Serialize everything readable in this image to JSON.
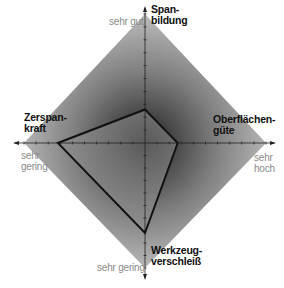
{
  "chart_data": {
    "type": "radar",
    "title": "",
    "axes": [
      {
        "name": "Spanbildung",
        "label_lines": [
          "Span-",
          "bildung"
        ],
        "direction": "top",
        "scale_label": "sehr gut",
        "value": 0.26
      },
      {
        "name": "Oberflächengüte",
        "label_lines": [
          "Oberflächen-",
          "güte"
        ],
        "direction": "right",
        "scale_label_lines": [
          "sehr",
          "hoch"
        ],
        "value": 0.27
      },
      {
        "name": "Werkzeugverschleiß",
        "label_lines": [
          "Werkzeug-",
          "verschleiß"
        ],
        "direction": "bottom",
        "scale_label": "sehr gering",
        "value": 0.72
      },
      {
        "name": "Zerspankraft",
        "label_lines": [
          "Zerspan-",
          "kraft"
        ],
        "direction": "left",
        "scale_label_lines": [
          "sehr",
          "gering"
        ],
        "value": 0.72
      }
    ],
    "range": [
      0,
      1
    ],
    "grid": false,
    "legend": "none",
    "ticks_per_axis": 10
  },
  "labels": {
    "top_title_1": "Span-",
    "top_title_2": "bildung",
    "top_scale": "sehr gut",
    "right_title_1": "Oberflächen-",
    "right_title_2": "güte",
    "right_scale_1": "sehr",
    "right_scale_2": "hoch",
    "bottom_title_1": "Werkzeug-",
    "bottom_title_2": "verschleiß",
    "bottom_scale": "sehr gering",
    "left_title_1": "Zerspan-",
    "left_title_2": "kraft",
    "left_scale_1": "sehr",
    "left_scale_2": "gering"
  },
  "colors": {
    "diamond_outer": "#b4b4b4",
    "diamond_center": "#1e1e1e",
    "polygon_stroke": "#111111",
    "axis": "#222222"
  }
}
